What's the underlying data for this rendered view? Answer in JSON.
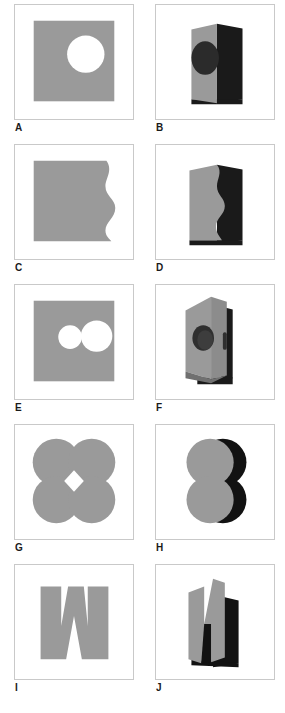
{
  "figure": {
    "columns": [
      "flat",
      "folded"
    ],
    "rows": 5,
    "colors": {
      "shape_gray": "#9a9a9a",
      "shape_gray_dark": "#8c8c8c",
      "shadow_black": "#1a1a1a",
      "hole_white": "#ffffff",
      "frame_border": "#c9c9c9",
      "background": "#ffffff",
      "label_text": "#1a1a1a"
    },
    "panels": [
      {
        "label": "A",
        "column": "left",
        "type": "flat",
        "description": "gray square with one white circular hole right of center",
        "shape_name": "square-one-hole"
      },
      {
        "label": "B",
        "column": "right",
        "type": "folded",
        "description": "folded card, gray front panel with dark ellipse hole, black back panel",
        "shape_name": "folded-square-one-hole"
      },
      {
        "label": "C",
        "column": "left",
        "type": "flat",
        "description": "gray square with wavy scalloped right edge",
        "shape_name": "square-wavy-edge"
      },
      {
        "label": "D",
        "column": "right",
        "type": "folded",
        "description": "folded card, gray front panel with wavy right edge, black back panel",
        "shape_name": "folded-square-wavy-edge"
      },
      {
        "label": "E",
        "column": "left",
        "type": "flat",
        "description": "gray square with two white circular holes, small left and large right",
        "shape_name": "square-two-holes"
      },
      {
        "label": "F",
        "column": "right",
        "type": "folded",
        "description": "steeply folded card viewed near edge-on, gray panels with dark oval hole",
        "shape_name": "folded-square-two-holes"
      },
      {
        "label": "G",
        "column": "left",
        "type": "flat",
        "description": "gray quatrefoil of four overlapping circles with small white diamond hole at center",
        "shape_name": "quatrefoil-four-circles"
      },
      {
        "label": "H",
        "column": "right",
        "type": "folded",
        "description": "folded quatrefoil, two gray lobes in front with black lobes behind",
        "shape_name": "folded-quatrefoil"
      },
      {
        "label": "I",
        "column": "left",
        "type": "flat",
        "description": "gray zigzag W / M letterform shape",
        "shape_name": "zigzag-w"
      },
      {
        "label": "J",
        "column": "right",
        "type": "folded",
        "description": "folded zigzag shape reading as N with black shadow behind",
        "shape_name": "folded-zigzag-n"
      }
    ]
  }
}
